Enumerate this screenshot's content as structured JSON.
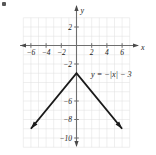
{
  "figure": {
    "corner_mark": "•"
  },
  "chart_data": {
    "type": "line",
    "title": "",
    "subtitle": "",
    "xlabel": "x",
    "ylabel": "y",
    "xlim": [
      -7.2,
      7.2
    ],
    "ylim": [
      -11.0,
      3.2
    ],
    "grid": true,
    "grid_spacing": 1,
    "legend": "none",
    "annotations": [
      {
        "name": "equation-label",
        "text": "y = −|x| − 3",
        "x": 2.0,
        "y": -3.3
      }
    ],
    "xticks": [
      -6,
      -4,
      -2,
      2,
      4,
      6
    ],
    "xtick_labels": [
      "−6",
      "−4",
      "−2",
      "2",
      "4",
      "6"
    ],
    "yticks": [
      2,
      -2,
      -6,
      -8,
      -10
    ],
    "ytick_labels": [
      "2",
      "−2",
      "−6",
      "−8",
      "−10"
    ],
    "series": [
      {
        "name": "y = -|x| - 3",
        "equation": "y = -|x| - 3",
        "vertex": [
          0,
          -3
        ],
        "arrows": [
          "start",
          "end"
        ],
        "x": [
          -6.0,
          0,
          6.0
        ],
        "values": [
          -9.0,
          -3,
          -9.0
        ]
      }
    ]
  },
  "axis": {
    "x_name": "x",
    "y_name": "y",
    "x_arrows": [
      "left",
      "right"
    ],
    "y_arrows": [
      "up",
      "down"
    ]
  },
  "colors": {
    "curve": "#1a1a1a",
    "axis": "#6e6e6e",
    "grid": "#dcdcdc",
    "text": "#1a1a1a",
    "background": "#ffffff"
  }
}
